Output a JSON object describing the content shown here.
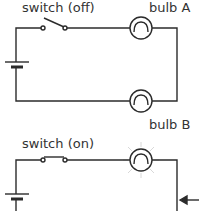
{
  "diagram": {
    "type": "circuit",
    "circuits": [
      {
        "id": "series-off",
        "switch_label": "switch (off)",
        "switch_state": "off",
        "bulbs": [
          {
            "label": "bulb A",
            "lit": false
          },
          {
            "label": "bulb B",
            "lit": false
          }
        ]
      },
      {
        "id": "single-on",
        "switch_label": "switch (on)",
        "switch_state": "on",
        "bulbs": [
          {
            "label": "",
            "lit": true
          }
        ],
        "arrow": "left-pointing arrow at right wire"
      }
    ]
  },
  "colors": {
    "wire": "#2b2b2b",
    "glow": "#e0e0e0",
    "text": "#333333"
  }
}
